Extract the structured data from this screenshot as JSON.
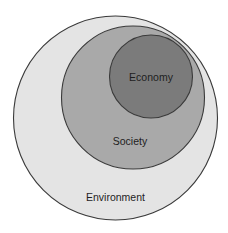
{
  "diagram": {
    "type": "nested-circles",
    "background": "#ffffff",
    "stroke_color": "#3a3a3a",
    "text_color": "#1e1e1e",
    "circles": [
      {
        "id": "environment",
        "label": "Environment",
        "cx": 115.5,
        "cy": 118,
        "r": 102,
        "fill": "#e4e4e4",
        "label_x": 115.5,
        "label_y": 197
      },
      {
        "id": "society",
        "label": "Society",
        "cx": 133,
        "cy": 97.5,
        "r": 71.5,
        "fill": "#a9a9a9",
        "label_x": 130,
        "label_y": 141
      },
      {
        "id": "economy",
        "label": "Economy",
        "cx": 151,
        "cy": 76.5,
        "r": 41.5,
        "fill": "#7b7b7b",
        "label_x": 151,
        "label_y": 77
      }
    ]
  }
}
